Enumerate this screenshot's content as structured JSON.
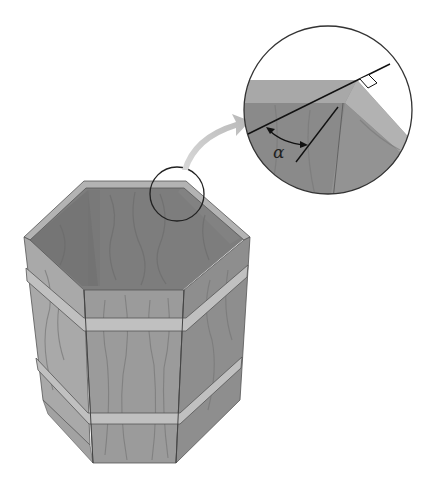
{
  "figure": {
    "callout_label": "α",
    "colors": {
      "background": "#ffffff",
      "wood_front": "#9a9a9a",
      "wood_side_light": "#a8a8a8",
      "wood_side_dark": "#8a8a8a",
      "wood_interior": "#7e7e7e",
      "rim": "#b0b0b0",
      "band": "#bdbdbd",
      "grain": "#6f6f6f",
      "outline": "#333333",
      "arrow": "#c4c4c4"
    }
  }
}
